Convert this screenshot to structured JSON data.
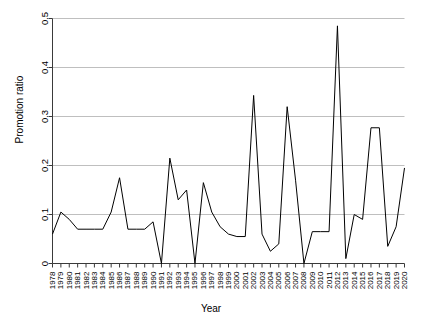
{
  "chart_data": {
    "type": "line",
    "title": "",
    "xlabel": "Year",
    "ylabel": "Promotion ratio",
    "xlim": [
      1978,
      2020
    ],
    "ylim": [
      0,
      0.5
    ],
    "grid": true,
    "legend": null,
    "y_ticks": [
      0,
      0.1,
      0.2,
      0.3,
      0.4,
      0.5
    ],
    "y_tick_labels": [
      "0",
      "0.1",
      "0.2",
      "0.3",
      "0.4",
      "0.5"
    ],
    "x": [
      1978,
      1979,
      1980,
      1981,
      1982,
      1983,
      1984,
      1985,
      1986,
      1987,
      1988,
      1989,
      1990,
      1991,
      1992,
      1993,
      1994,
      1995,
      1996,
      1997,
      1998,
      1999,
      2000,
      2001,
      2002,
      2003,
      2004,
      2005,
      2006,
      2007,
      2008,
      2009,
      2010,
      2011,
      2012,
      2013,
      2014,
      2015,
      2016,
      2017,
      2018,
      2019,
      2020
    ],
    "x_tick_labels": [
      "1978",
      "1979",
      "1980",
      "1981",
      "1982",
      "1983",
      "1984",
      "1985",
      "1986",
      "1987",
      "1988",
      "1989",
      "1990",
      "1991",
      "1992",
      "1993",
      "1994",
      "1995",
      "1996",
      "1997",
      "1998",
      "1999",
      "2000",
      "2001",
      "2002",
      "2003",
      "2004",
      "2005",
      "2006",
      "2007",
      "2008",
      "2009",
      "2010",
      "2011",
      "2012",
      "2013",
      "2014",
      "2015",
      "2016",
      "2017",
      "2018",
      "2019",
      "2020"
    ],
    "series": [
      {
        "name": "Promotion ratio",
        "color": "#000000",
        "values": [
          0.06,
          0.105,
          0.09,
          0.07,
          0.07,
          0.07,
          0.07,
          0.105,
          0.175,
          0.07,
          0.07,
          0.07,
          0.085,
          0.0,
          0.215,
          0.13,
          0.15,
          0.0,
          0.165,
          0.105,
          0.075,
          0.06,
          0.055,
          0.055,
          0.343,
          0.06,
          0.025,
          0.04,
          0.32,
          0.17,
          0.0,
          0.065,
          0.065,
          0.065,
          0.485,
          0.01,
          0.1,
          0.09,
          0.277,
          0.277,
          0.035,
          0.075,
          0.195
        ]
      }
    ]
  },
  "axes": {
    "x_title": "Year",
    "y_title": "Promotion ratio"
  }
}
